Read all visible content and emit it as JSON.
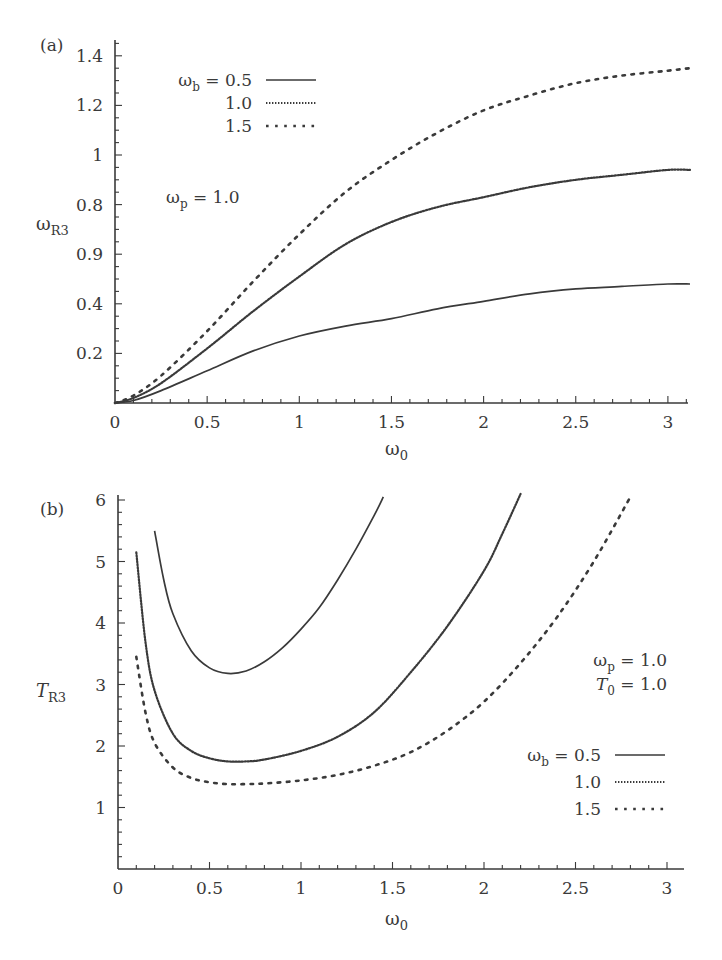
{
  "chart_data": [
    {
      "panel_label": "(a)",
      "type": "line",
      "title": "",
      "xlabel": "ω0",
      "xlabel_main": "ω",
      "xlabel_sub": "0",
      "ylabel": "ωR3",
      "ylabel_main": "ω",
      "ylabel_sub": "R3",
      "xlim": [
        0,
        3.14
      ],
      "ylim": [
        0,
        1.45
      ],
      "xticks": [
        0,
        0.5,
        1,
        1.5,
        2,
        2.5,
        3
      ],
      "xtick_labels": [
        "0",
        "0.5",
        "1",
        "1.5",
        "2",
        "2.5",
        "3"
      ],
      "yticks": [
        0.2,
        0.4,
        0.6,
        0.8,
        1.0,
        1.2,
        1.4
      ],
      "ytick_labels": [
        "0.2",
        "0.4",
        "0.9",
        "0.8",
        "1",
        "1.2",
        "1.4"
      ],
      "grid": false,
      "legend_position": "upper-left",
      "legend_title_main": "ω",
      "legend_title_sub": "b",
      "annotations": [
        {
          "main": "ω",
          "sub": "p",
          "text": " = 1.0"
        }
      ],
      "series": [
        {
          "name": "ωb = 0.5",
          "label": "= 0.5",
          "style": "solid",
          "x": [
            0,
            0.1,
            0.25,
            0.5,
            0.75,
            1.0,
            1.25,
            1.5,
            1.75,
            2.0,
            2.25,
            2.5,
            2.75,
            3.0,
            3.12
          ],
          "y": [
            0,
            0.01,
            0.05,
            0.13,
            0.21,
            0.27,
            0.31,
            0.34,
            0.38,
            0.41,
            0.44,
            0.46,
            0.47,
            0.48,
            0.48
          ]
        },
        {
          "name": "ωb = 1.0",
          "label": "1.0",
          "style": "dotted",
          "x": [
            0,
            0.1,
            0.25,
            0.5,
            0.75,
            1.0,
            1.25,
            1.5,
            1.75,
            2.0,
            2.25,
            2.5,
            2.75,
            3.0,
            3.12
          ],
          "y": [
            0,
            0.02,
            0.08,
            0.22,
            0.37,
            0.51,
            0.64,
            0.73,
            0.79,
            0.83,
            0.87,
            0.9,
            0.92,
            0.94,
            0.94
          ]
        },
        {
          "name": "ωb = 1.5",
          "label": "1.5",
          "style": "dashed",
          "x": [
            0,
            0.1,
            0.25,
            0.5,
            0.75,
            1.0,
            1.25,
            1.5,
            1.75,
            2.0,
            2.25,
            2.5,
            2.75,
            3.0,
            3.12
          ],
          "y": [
            0,
            0.03,
            0.11,
            0.29,
            0.49,
            0.68,
            0.85,
            0.98,
            1.09,
            1.18,
            1.24,
            1.29,
            1.32,
            1.34,
            1.35
          ]
        }
      ]
    },
    {
      "panel_label": "(b)",
      "type": "line",
      "title": "",
      "xlabel": "ω0",
      "xlabel_main": "ω",
      "xlabel_sub": "0",
      "ylabel": "TR3",
      "ylabel_main": "T",
      "ylabel_sub": "R3",
      "xlim": [
        0,
        3.1
      ],
      "ylim": [
        0,
        6.1
      ],
      "xticks": [
        0,
        0.5,
        1,
        1.5,
        2,
        2.5,
        3
      ],
      "xtick_labels": [
        "0",
        "0.5",
        "1",
        "1.5",
        "2",
        "2.5",
        "3"
      ],
      "yticks": [
        1,
        2,
        3,
        4,
        5,
        6
      ],
      "ytick_labels": [
        "1",
        "2",
        "3",
        "4",
        "5",
        "6"
      ],
      "grid": false,
      "legend_position": "lower-right",
      "legend_title_main": "ω",
      "legend_title_sub": "b",
      "annotations": [
        {
          "main": "ω",
          "sub": "p",
          "text": " = 1.0"
        },
        {
          "main": "T",
          "sub": "0",
          "text": " = 1.0"
        }
      ],
      "series": [
        {
          "name": "ωb = 0.5",
          "label": "= 0.5",
          "style": "solid",
          "x": [
            0.2,
            0.25,
            0.3,
            0.4,
            0.5,
            0.6,
            0.7,
            0.8,
            0.9,
            1.0,
            1.1,
            1.2,
            1.3,
            1.4,
            1.45
          ],
          "y": [
            5.5,
            4.7,
            4.15,
            3.55,
            3.27,
            3.18,
            3.22,
            3.37,
            3.6,
            3.9,
            4.25,
            4.7,
            5.2,
            5.75,
            6.05
          ]
        },
        {
          "name": "ωb = 1.0",
          "label": "1.0",
          "style": "dotted",
          "x": [
            0.1,
            0.15,
            0.2,
            0.3,
            0.4,
            0.5,
            0.6,
            0.7,
            0.8,
            1.0,
            1.2,
            1.4,
            1.6,
            1.8,
            2.0,
            2.1,
            2.2
          ],
          "y": [
            5.15,
            3.7,
            2.9,
            2.2,
            1.92,
            1.8,
            1.75,
            1.75,
            1.78,
            1.92,
            2.15,
            2.55,
            3.2,
            3.95,
            4.85,
            5.45,
            6.1
          ]
        },
        {
          "name": "ωb = 1.5",
          "label": "1.5",
          "style": "dashed",
          "x": [
            0.1,
            0.15,
            0.2,
            0.3,
            0.4,
            0.5,
            0.6,
            0.7,
            0.8,
            1.0,
            1.2,
            1.4,
            1.6,
            1.8,
            2.0,
            2.2,
            2.4,
            2.6,
            2.8
          ],
          "y": [
            3.45,
            2.55,
            2.05,
            1.65,
            1.48,
            1.41,
            1.38,
            1.38,
            1.39,
            1.44,
            1.53,
            1.68,
            1.9,
            2.25,
            2.72,
            3.35,
            4.1,
            5.0,
            6.05
          ]
        }
      ]
    }
  ]
}
